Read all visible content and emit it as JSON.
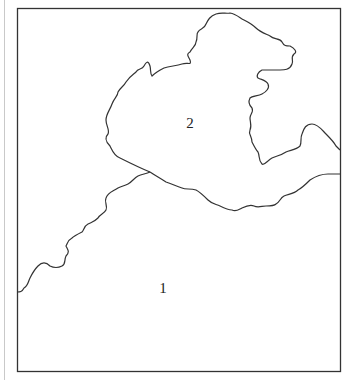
{
  "figure": {
    "frame": {
      "x": 17,
      "y": 8,
      "width": 323,
      "height": 363
    },
    "line_color": "#333333",
    "regions": [
      {
        "id": "region-1",
        "label": "1",
        "label_x": 163,
        "label_y": 288
      },
      {
        "id": "region-2",
        "label": "2",
        "label_x": 190,
        "label_y": 123
      }
    ]
  }
}
